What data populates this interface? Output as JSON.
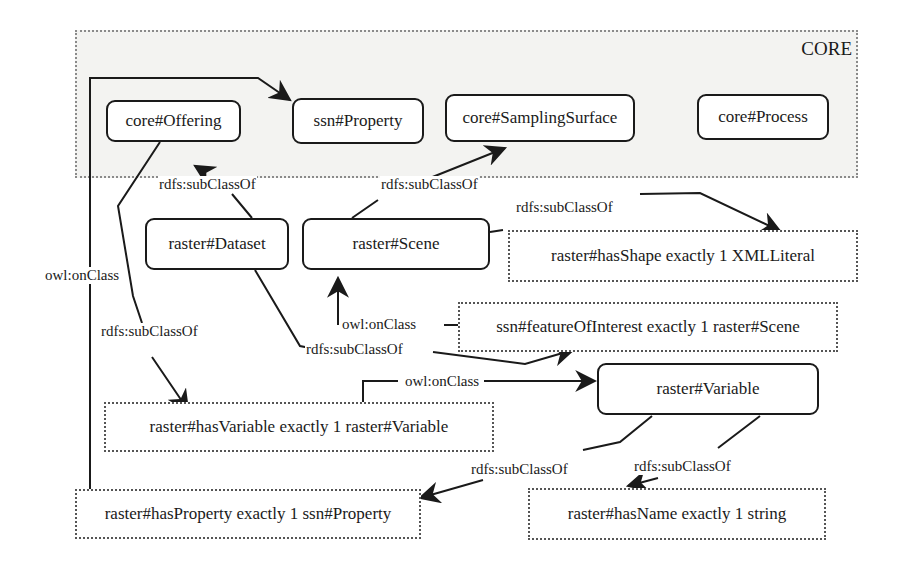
{
  "diagram": {
    "group": {
      "label": "CORE"
    },
    "nodes": {
      "core_offering": "core#Offering",
      "ssn_property": "ssn#Property",
      "core_sampling_surface": "core#SamplingSurface",
      "core_process": "core#Process",
      "raster_dataset": "raster#Dataset",
      "raster_scene": "raster#Scene",
      "has_shape": "raster#hasShape exactly 1 XMLLiteral",
      "feature_of_interest": "ssn#featureOfInterest exactly 1 raster#Scene",
      "raster_variable": "raster#Variable",
      "has_variable": "raster#hasVariable exactly 1 raster#Variable",
      "has_property": "raster#hasProperty exactly 1 ssn#Property",
      "has_name": "raster#hasName exactly 1 string"
    },
    "edge_labels": {
      "dataset_subclass_offering": "rdfs:subClassOf",
      "scene_subclass_sampling": "rdfs:subClassOf",
      "scene_subclass_hasshape": "rdfs:subClassOf",
      "haspropery_onclass_property": "owl:onClass",
      "offering_subclass_hasvariable": "rdfs:subClassOf",
      "foi_onclass_scene": "owl:onClass",
      "dataset_subclass_foi": "rdfs:subClassOf",
      "hasvariable_onclass_variable": "owl:onClass",
      "variable_subclass_hasproperty": "rdfs:subClassOf",
      "variable_subclass_hasname": "rdfs:subClassOf"
    }
  }
}
